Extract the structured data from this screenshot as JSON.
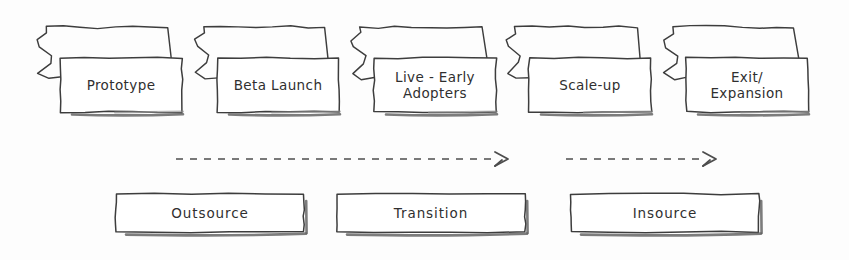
{
  "diagram": {
    "ink_color": "#3d3d3d",
    "paper_color": "#ffffff",
    "background_color": "#fdfdfd"
  },
  "stages": [
    {
      "id": "prototype",
      "label": "Prototype",
      "x": 60,
      "y": 58,
      "w": 122,
      "h": 54
    },
    {
      "id": "beta-launch",
      "label": "Beta Launch",
      "x": 217,
      "y": 58,
      "w": 122,
      "h": 54
    },
    {
      "id": "live-early",
      "label": "Live - Early\nAdopters",
      "x": 374,
      "y": 58,
      "w": 122,
      "h": 54
    },
    {
      "id": "scale-up",
      "label": "Scale-up",
      "x": 529,
      "y": 58,
      "w": 122,
      "h": 54
    },
    {
      "id": "exit-expansion",
      "label": "Exit/\nExpansion",
      "x": 686,
      "y": 58,
      "w": 122,
      "h": 54
    }
  ],
  "arrows": [
    {
      "id": "outsource-to-transition",
      "x1": 176,
      "y1": 159,
      "x2": 508,
      "y2": 159
    },
    {
      "id": "transition-to-insource",
      "x1": 566,
      "y1": 159,
      "x2": 716,
      "y2": 159
    }
  ],
  "phases": [
    {
      "id": "outsource",
      "label": "Outsource",
      "x": 116,
      "y": 194,
      "w": 188,
      "h": 38
    },
    {
      "id": "transition",
      "label": "Transition",
      "x": 337,
      "y": 194,
      "w": 188,
      "h": 38
    },
    {
      "id": "insource",
      "label": "Insource",
      "x": 571,
      "y": 194,
      "w": 188,
      "h": 38
    }
  ]
}
